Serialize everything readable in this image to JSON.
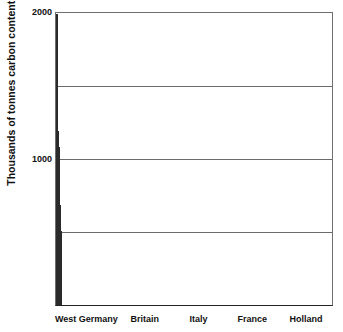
{
  "chart_data": {
    "type": "bar",
    "title": "",
    "subtitle": "",
    "xlabel": "",
    "ylabel": "Thousands of tonnes carbon content",
    "categories": [
      "West Germany",
      "Britain",
      "Italy",
      "France",
      "Holland"
    ],
    "values": [
      1995,
      1190,
      1080,
      685,
      510
    ],
    "ylim": [
      0,
      2000
    ],
    "xlim_note": "categorical",
    "y_ticks": [
      1000,
      2000
    ],
    "y_tick_labels": [
      "1000",
      "2000"
    ],
    "gridlines_y": [
      500,
      1000,
      1500,
      2000
    ],
    "grid": true,
    "legend": null,
    "legend_position": "none",
    "annotations": [],
    "series": [
      {
        "name": "Carbon content",
        "values": [
          1995,
          1190,
          1080,
          685,
          510
        ]
      }
    ],
    "bar_fill": "#8c8c8c",
    "bar_fill_style": "50% checkerboard dither",
    "bar_edge_color": "#2b2b2b",
    "gridline_color": "#6a6a6a",
    "background_color": "#ffffff",
    "text_color": "#111111"
  },
  "axes": {
    "y": {
      "title": "Thousands of tonnes carbon content",
      "ticks": [
        {
          "label": "2000",
          "value": 2000
        },
        {
          "label": "1000",
          "value": 1000
        }
      ]
    },
    "x": {
      "categories": [
        {
          "label": "West Germany"
        },
        {
          "label": "Britain"
        },
        {
          "label": "Italy"
        },
        {
          "label": "France"
        },
        {
          "label": "Holland"
        }
      ]
    }
  }
}
